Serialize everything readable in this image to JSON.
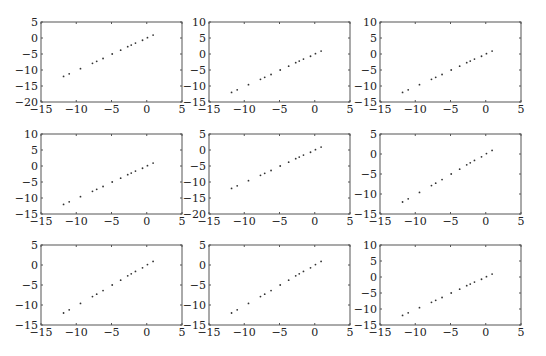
{
  "chart_data": [
    {
      "type": "scatter",
      "title": "",
      "xlabel": "",
      "ylabel": "",
      "xlim": [
        -15,
        5
      ],
      "ylim": [
        -20,
        5
      ],
      "xticks": [
        -15,
        -10,
        -5,
        0,
        5
      ],
      "yticks": [
        -20,
        -15,
        -10,
        -5,
        0,
        5
      ],
      "x": [
        -11.8,
        -11.0,
        -9.4,
        -7.7,
        -7.1,
        -6.2,
        -4.9,
        -3.7,
        -2.7,
        -2.2,
        -1.6,
        -0.6,
        0.1,
        0.9
      ],
      "y": [
        -12.0,
        -11.2,
        -9.6,
        -7.9,
        -7.3,
        -6.4,
        -5.0,
        -3.8,
        -2.7,
        -2.2,
        -1.6,
        -0.7,
        0.1,
        0.9
      ]
    },
    {
      "type": "scatter",
      "title": "",
      "xlabel": "",
      "ylabel": "",
      "xlim": [
        -15,
        5
      ],
      "ylim": [
        -15,
        10
      ],
      "xticks": [
        -15,
        -10,
        -5,
        0,
        5
      ],
      "yticks": [
        -15,
        -10,
        -5,
        0,
        5,
        10
      ],
      "x": [
        -11.8,
        -11.0,
        -9.4,
        -7.7,
        -7.1,
        -6.2,
        -4.9,
        -3.7,
        -2.7,
        -2.2,
        -1.6,
        -0.6,
        0.1,
        0.9
      ],
      "y": [
        -12.0,
        -11.2,
        -9.6,
        -7.9,
        -7.3,
        -6.4,
        -5.0,
        -3.8,
        -2.7,
        -2.2,
        -1.6,
        -0.7,
        0.1,
        0.9
      ]
    },
    {
      "type": "scatter",
      "title": "",
      "xlabel": "",
      "ylabel": "",
      "xlim": [
        -15,
        5
      ],
      "ylim": [
        -15,
        10
      ],
      "xticks": [
        -15,
        -10,
        -5,
        0,
        5
      ],
      "yticks": [
        -15,
        -10,
        -5,
        0,
        5,
        10
      ],
      "x": [
        -11.8,
        -11.0,
        -9.4,
        -7.7,
        -7.1,
        -6.2,
        -4.9,
        -3.7,
        -2.7,
        -2.2,
        -1.6,
        -0.6,
        0.1,
        0.9
      ],
      "y": [
        -12.0,
        -11.2,
        -9.6,
        -7.9,
        -7.3,
        -6.4,
        -5.0,
        -3.8,
        -2.7,
        -2.2,
        -1.6,
        -0.7,
        0.1,
        0.9
      ]
    },
    {
      "type": "scatter",
      "title": "",
      "xlabel": "",
      "ylabel": "",
      "xlim": [
        -15,
        5
      ],
      "ylim": [
        -15,
        10
      ],
      "xticks": [
        -15,
        -10,
        -5,
        0,
        5
      ],
      "yticks": [
        -15,
        -10,
        -5,
        0,
        5,
        10
      ],
      "x": [
        -11.8,
        -11.0,
        -9.4,
        -7.7,
        -7.1,
        -6.2,
        -4.9,
        -3.7,
        -2.7,
        -2.2,
        -1.6,
        -0.6,
        0.1,
        0.9
      ],
      "y": [
        -12.0,
        -11.2,
        -9.6,
        -7.9,
        -7.3,
        -6.4,
        -5.0,
        -3.8,
        -2.7,
        -2.2,
        -1.6,
        -0.7,
        0.1,
        0.9
      ]
    },
    {
      "type": "scatter",
      "title": "",
      "xlabel": "",
      "ylabel": "",
      "xlim": [
        -15,
        5
      ],
      "ylim": [
        -20,
        5
      ],
      "xticks": [
        -15,
        -10,
        -5,
        0,
        5
      ],
      "yticks": [
        -20,
        -15,
        -10,
        -5,
        0,
        5
      ],
      "x": [
        -11.8,
        -11.0,
        -9.4,
        -7.7,
        -7.1,
        -6.2,
        -4.9,
        -3.7,
        -2.7,
        -2.2,
        -1.6,
        -0.6,
        0.1,
        0.9
      ],
      "y": [
        -12.0,
        -11.2,
        -9.6,
        -7.9,
        -7.3,
        -6.4,
        -5.0,
        -3.8,
        -2.7,
        -2.2,
        -1.6,
        -0.7,
        0.1,
        0.9
      ]
    },
    {
      "type": "scatter",
      "title": "",
      "xlabel": "",
      "ylabel": "",
      "xlim": [
        -15,
        5
      ],
      "ylim": [
        -15,
        5
      ],
      "xticks": [
        -15,
        -10,
        -5,
        0,
        5
      ],
      "yticks": [
        -15,
        -10,
        -5,
        0,
        5
      ],
      "x": [
        -11.8,
        -11.0,
        -9.4,
        -7.7,
        -7.1,
        -6.2,
        -4.9,
        -3.7,
        -2.7,
        -2.2,
        -1.6,
        -0.6,
        0.1,
        0.9
      ],
      "y": [
        -12.0,
        -11.2,
        -9.6,
        -7.9,
        -7.3,
        -6.4,
        -5.0,
        -3.8,
        -2.7,
        -2.2,
        -1.6,
        -0.7,
        0.1,
        0.9
      ]
    },
    {
      "type": "scatter",
      "title": "",
      "xlabel": "",
      "ylabel": "",
      "xlim": [
        -15,
        5
      ],
      "ylim": [
        -15,
        5
      ],
      "xticks": [
        -15,
        -10,
        -5,
        0,
        5
      ],
      "yticks": [
        -15,
        -10,
        -5,
        0,
        5
      ],
      "x": [
        -11.8,
        -11.0,
        -9.4,
        -7.7,
        -7.1,
        -6.2,
        -4.9,
        -3.7,
        -2.7,
        -2.2,
        -1.6,
        -0.6,
        0.1,
        0.9
      ],
      "y": [
        -12.0,
        -11.2,
        -9.6,
        -7.9,
        -7.3,
        -6.4,
        -5.0,
        -3.8,
        -2.7,
        -2.2,
        -1.6,
        -0.7,
        0.1,
        0.9
      ]
    },
    {
      "type": "scatter",
      "title": "",
      "xlabel": "",
      "ylabel": "",
      "xlim": [
        -15,
        5
      ],
      "ylim": [
        -15,
        5
      ],
      "xticks": [
        -15,
        -10,
        -5,
        0,
        5
      ],
      "yticks": [
        -15,
        -10,
        -5,
        0,
        5
      ],
      "x": [
        -11.8,
        -11.0,
        -9.4,
        -7.7,
        -7.1,
        -6.2,
        -4.9,
        -3.7,
        -2.7,
        -2.2,
        -1.6,
        -0.6,
        0.1,
        0.9
      ],
      "y": [
        -12.0,
        -11.2,
        -9.6,
        -7.9,
        -7.3,
        -6.4,
        -5.0,
        -3.8,
        -2.7,
        -2.2,
        -1.6,
        -0.7,
        0.1,
        0.9
      ]
    },
    {
      "type": "scatter",
      "title": "",
      "xlabel": "",
      "ylabel": "",
      "xlim": [
        -15,
        5
      ],
      "ylim": [
        -15,
        10
      ],
      "xticks": [
        -15,
        -10,
        -5,
        0,
        5
      ],
      "yticks": [
        -15,
        -10,
        -5,
        0,
        5,
        10
      ],
      "x": [
        -11.8,
        -11.0,
        -9.4,
        -7.7,
        -7.1,
        -6.2,
        -4.9,
        -3.7,
        -2.7,
        -2.2,
        -1.6,
        -0.6,
        0.1,
        0.9
      ],
      "y": [
        -12.0,
        -11.2,
        -9.6,
        -7.9,
        -7.3,
        -6.4,
        -5.0,
        -3.8,
        -2.7,
        -2.2,
        -1.6,
        -0.7,
        0.1,
        0.9
      ]
    }
  ]
}
